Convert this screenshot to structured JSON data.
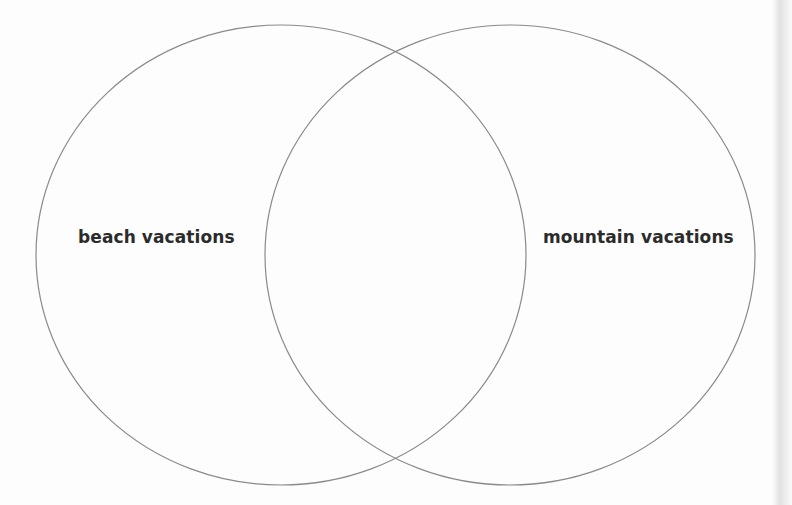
{
  "diagram": {
    "type": "venn",
    "stroke_color": "#8a8a8a",
    "background": "#fdfdfd",
    "text_color": "#2b2b2b",
    "sets": [
      {
        "id": "left",
        "label": "beach vacations",
        "shape": {
          "cx": 281,
          "cy": 255,
          "rx": 245,
          "ry": 230
        }
      },
      {
        "id": "right",
        "label": "mountain vacations",
        "shape": {
          "cx": 510,
          "cy": 255,
          "rx": 245,
          "ry": 230
        }
      }
    ],
    "intersection_label": ""
  }
}
